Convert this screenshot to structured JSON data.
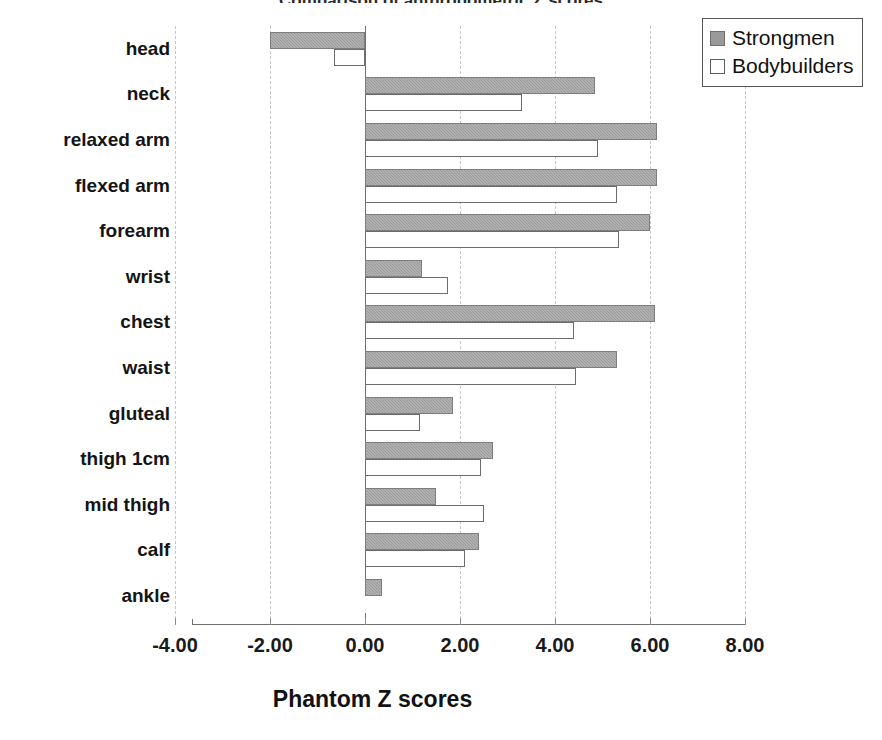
{
  "chart_data": {
    "type": "bar",
    "orientation": "horizontal",
    "title": "Comparison of anthropometric Z scores",
    "title_clipped": true,
    "xlabel": "Phantom Z scores",
    "ylabel": "",
    "xlim": [
      -4.0,
      8.0
    ],
    "xticks": [
      "-4.00",
      "-2.00",
      "0.00",
      "2.00",
      "4.00",
      "6.00",
      "8.00"
    ],
    "xtick_values": [
      -4.0,
      -2.0,
      0.0,
      2.0,
      4.0,
      6.0,
      8.0
    ],
    "grid": "vertical-dashed",
    "legend_position": "top-right",
    "categories": [
      "head",
      "neck",
      "relaxed arm",
      "flexed arm",
      "forearm",
      "wrist",
      "chest",
      "waist",
      "gluteal",
      "thigh 1cm",
      "mid thigh",
      "calf",
      "ankle"
    ],
    "series": [
      {
        "name": "Strongmen",
        "color": "#9a9a9a",
        "values": [
          -2.0,
          4.85,
          6.15,
          6.15,
          6.0,
          1.2,
          6.1,
          5.3,
          1.85,
          2.7,
          1.5,
          2.4,
          0.35
        ]
      },
      {
        "name": "Bodybuilders",
        "color": "#ffffff",
        "values": [
          -0.65,
          3.3,
          4.9,
          5.3,
          5.35,
          1.75,
          4.4,
          4.45,
          1.15,
          2.45,
          2.5,
          2.1,
          0.02
        ]
      }
    ]
  },
  "legend": {
    "items": [
      {
        "label": "Strongmen",
        "swatch": "filled-gray-square"
      },
      {
        "label": "Bodybuilders",
        "swatch": "empty-white-square"
      }
    ]
  },
  "axis": {
    "x_title": "Phantom Z scores"
  },
  "colors": {
    "bar_strongmen": "#9a9a9a",
    "bar_bodybuilders": "#ffffff",
    "bar_outline": "#6f6f6f",
    "gridline": "#c8c8c8",
    "axis": "#6f6f6f",
    "text": "#111111",
    "background": "#ffffff"
  }
}
